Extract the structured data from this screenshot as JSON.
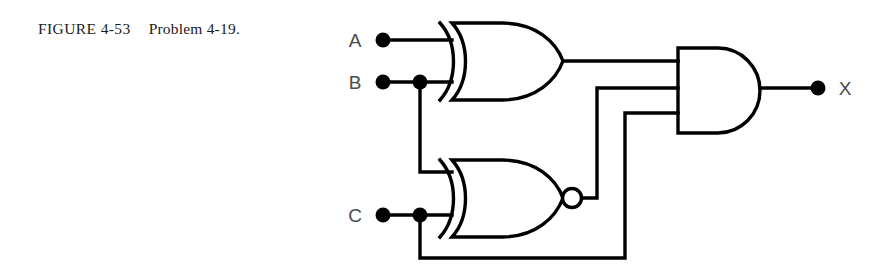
{
  "figure": {
    "label": "FIGURE 4-53",
    "caption": "Problem 4-19.",
    "full_caption": "FIGURE 4-53   Problem 4-19."
  },
  "circuit": {
    "inputs": [
      {
        "name": "A",
        "label": "A",
        "terminal_x": 383,
        "terminal_y": 40
      },
      {
        "name": "B",
        "label": "B",
        "terminal_x": 383,
        "terminal_y": 82
      },
      {
        "name": "C",
        "label": "C",
        "terminal_x": 383,
        "terminal_y": 215
      }
    ],
    "outputs": [
      {
        "name": "X",
        "label": "X",
        "terminal_x": 818,
        "terminal_y": 88
      }
    ],
    "gates": [
      {
        "id": "gate-xor-1",
        "type": "XOR",
        "label": "XOR",
        "inputs": [
          "A",
          "B"
        ],
        "output": "xor1_out"
      },
      {
        "id": "gate-xnor-1",
        "type": "XNOR",
        "label": "XNOR",
        "inputs": [
          "B",
          "C"
        ],
        "output": "xnor1_out"
      },
      {
        "id": "gate-and-1",
        "type": "AND",
        "label": "AND",
        "inputs": [
          "xor1_out",
          "xnor1_out",
          "C"
        ],
        "output": "X"
      }
    ],
    "junctions": [
      {
        "on": "B",
        "x": 420,
        "y": 82
      },
      {
        "on": "C",
        "x": 420,
        "y": 215
      }
    ],
    "colors": {
      "wire": "#000000",
      "gate_outline": "#000000",
      "label_text": "#4a4a4a",
      "caption_text": "#1b1b1b",
      "background": "#ffffff"
    }
  }
}
